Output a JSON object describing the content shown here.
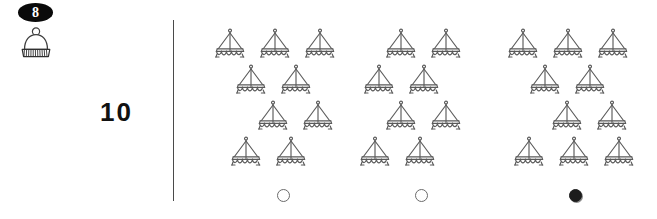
{
  "header": {
    "page_badge": "8",
    "badge_color": "#0a0a0a",
    "icon_name": "winter-hat-icon"
  },
  "exercise": {
    "number": "10"
  },
  "divider": {
    "color": "#4a4a4a"
  },
  "groups": [
    {
      "id": "group-1",
      "left": 206,
      "boat_count": 9,
      "rows": [
        {
          "top": 28,
          "left": 6,
          "count": 3
        },
        {
          "top": 64,
          "left": 27,
          "count": 2
        },
        {
          "top": 100,
          "left": 49,
          "count": 2
        },
        {
          "top": 136,
          "left": 22,
          "count": 2
        }
      ],
      "radio": {
        "left": 71,
        "top": 189,
        "selected": false
      }
    },
    {
      "id": "group-2",
      "left": 355,
      "boat_count": 8,
      "rows": [
        {
          "top": 28,
          "left": 28,
          "count": 2
        },
        {
          "top": 64,
          "left": 6,
          "count": 2
        },
        {
          "top": 100,
          "left": 28,
          "count": 2
        },
        {
          "top": 136,
          "left": 2,
          "count": 2
        }
      ],
      "radio": {
        "left": 60,
        "top": 189,
        "selected": false
      }
    },
    {
      "id": "group-3",
      "left": 501,
      "boat_count": 10,
      "rows": [
        {
          "top": 28,
          "left": 4,
          "count": 3
        },
        {
          "top": 64,
          "left": 26,
          "count": 2
        },
        {
          "top": 100,
          "left": 48,
          "count": 2
        },
        {
          "top": 136,
          "left": 10,
          "count": 3
        }
      ],
      "radio": {
        "left": 68,
        "top": 189,
        "selected": true
      }
    }
  ],
  "icons": {
    "boat": "sailboat-icon",
    "radio_empty": "radio-unselected-icon",
    "radio_filled": "radio-selected-icon"
  },
  "colors": {
    "background": "#ffffff",
    "ink": "#4f4f4f",
    "badge": "#0a0a0a",
    "selected_radio": "#1c1c1c"
  }
}
